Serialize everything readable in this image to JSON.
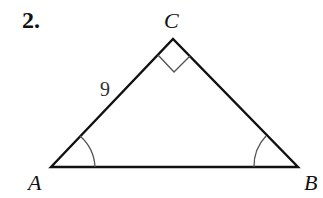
{
  "problem": {
    "number": "2."
  },
  "triangle": {
    "vertices": {
      "A": {
        "label": "A",
        "x": 51,
        "y": 167
      },
      "B": {
        "label": "B",
        "x": 298,
        "y": 167
      },
      "C": {
        "label": "C",
        "x": 173,
        "y": 39
      }
    },
    "sides": {
      "AC": {
        "label": "9"
      }
    },
    "markers": {
      "right_angle_at": "C",
      "angle_arcs_at": [
        "A",
        "B"
      ]
    },
    "stroke_color": "#111111",
    "marker_color": "#555555"
  }
}
